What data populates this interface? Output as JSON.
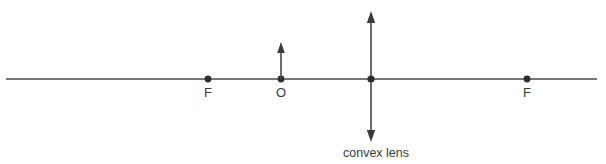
{
  "figure": {
    "background_color": "#ffffff",
    "stroke_color": "#4a4a4a",
    "text_color": "#3a3a3a"
  },
  "labels": {
    "focal_left": "F",
    "object": "O",
    "focal_right": "F",
    "caption": "convex lens"
  },
  "geometry": {
    "axis": {
      "x1": 6,
      "x2": 597,
      "y": 79
    },
    "focal_left_point": {
      "x": 208,
      "y": 79
    },
    "object_point": {
      "x": 281,
      "y": 79
    },
    "lens_center_point": {
      "x": 371,
      "y": 79
    },
    "focal_right_point": {
      "x": 527,
      "y": 79
    },
    "object_arrow": {
      "x": 281,
      "y_base": 79,
      "y_tip": 43
    },
    "lens_line": {
      "x": 371,
      "y_top": 12,
      "y_bottom": 141
    }
  }
}
